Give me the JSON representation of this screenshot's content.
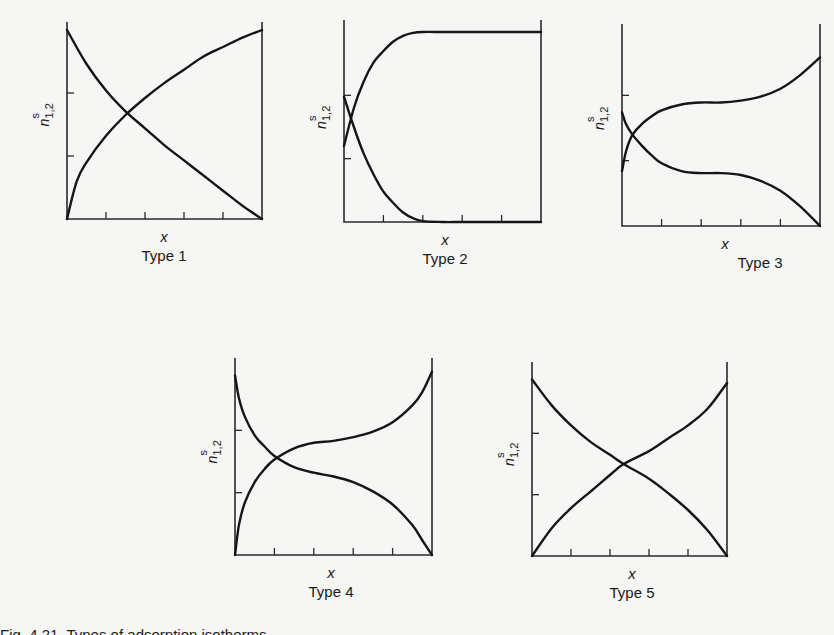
{
  "figure": {
    "caption_partial": "Fig. 4.21. Types of adsorption isotherms"
  },
  "chart_data": [
    {
      "type": "line",
      "title": "Type 1",
      "xlabel": "x",
      "ylabel": "n^s_{1,2}",
      "xlim": [
        0,
        1
      ],
      "ylim": [
        0,
        1
      ],
      "x_ticks": 4,
      "y_ticks": 2,
      "grid": false,
      "series": [
        {
          "name": "n^s_1 (decreasing)",
          "x": [
            0,
            0.1,
            0.2,
            0.3,
            0.4,
            0.5,
            0.6,
            0.7,
            0.8,
            0.9,
            1.0
          ],
          "y": [
            1.0,
            0.82,
            0.68,
            0.57,
            0.48,
            0.39,
            0.31,
            0.23,
            0.15,
            0.07,
            0.0
          ]
        },
        {
          "name": "n^s_2 (increasing)",
          "x": [
            0,
            0.05,
            0.1,
            0.2,
            0.3,
            0.4,
            0.5,
            0.6,
            0.7,
            0.8,
            0.9,
            1.0
          ],
          "y": [
            0.0,
            0.2,
            0.3,
            0.44,
            0.55,
            0.64,
            0.72,
            0.79,
            0.86,
            0.91,
            0.96,
            1.0
          ]
        }
      ]
    },
    {
      "type": "line",
      "title": "Type 2",
      "xlabel": "x",
      "ylabel": "n^s_{1,2}",
      "xlim": [
        0,
        1
      ],
      "ylim": [
        0,
        1
      ],
      "x_ticks": 4,
      "y_ticks": 2,
      "grid": false,
      "series": [
        {
          "name": "n^s_1 (decreasing)",
          "x": [
            0,
            0.05,
            0.1,
            0.15,
            0.2,
            0.25,
            0.3,
            0.35,
            0.4,
            0.5,
            0.6,
            0.8,
            1.0
          ],
          "y": [
            0.66,
            0.5,
            0.36,
            0.25,
            0.16,
            0.1,
            0.05,
            0.02,
            0.005,
            0,
            0,
            0,
            0
          ]
        },
        {
          "name": "n^s_2 (increasing)",
          "x": [
            0,
            0.05,
            0.1,
            0.15,
            0.2,
            0.25,
            0.3,
            0.35,
            0.4,
            0.5,
            0.6,
            0.8,
            1.0
          ],
          "y": [
            0.4,
            0.6,
            0.74,
            0.84,
            0.9,
            0.95,
            0.98,
            0.995,
            1.0,
            1.0,
            1.0,
            1.0,
            1.0
          ]
        }
      ]
    },
    {
      "type": "line",
      "title": "Type 3",
      "xlabel": "x",
      "ylabel": "n^s_{1,2}",
      "xlim": [
        0,
        1
      ],
      "ylim": [
        0,
        1
      ],
      "x_ticks": 4,
      "y_ticks": 2,
      "grid": false,
      "series": [
        {
          "name": "n^s_1 (decreasing)",
          "x": [
            0,
            0.02,
            0.05,
            0.1,
            0.15,
            0.2,
            0.3,
            0.4,
            0.5,
            0.6,
            0.7,
            0.8,
            0.9,
            1.0
          ],
          "y": [
            0.58,
            0.52,
            0.47,
            0.41,
            0.36,
            0.32,
            0.28,
            0.27,
            0.27,
            0.26,
            0.23,
            0.18,
            0.1,
            0.0
          ]
        },
        {
          "name": "n^s_2 (increasing)",
          "x": [
            0,
            0.02,
            0.05,
            0.1,
            0.15,
            0.2,
            0.3,
            0.4,
            0.5,
            0.6,
            0.7,
            0.8,
            0.9,
            1.0
          ],
          "y": [
            0.28,
            0.38,
            0.46,
            0.52,
            0.56,
            0.59,
            0.62,
            0.63,
            0.63,
            0.64,
            0.66,
            0.7,
            0.77,
            0.86
          ]
        }
      ]
    },
    {
      "type": "line",
      "title": "Type 4",
      "xlabel": "x",
      "ylabel": "n^s_{1,2}",
      "xlim": [
        0,
        1
      ],
      "ylim": [
        0,
        1
      ],
      "x_ticks": 4,
      "y_ticks": 2,
      "grid": false,
      "series": [
        {
          "name": "n^s_1 (decreasing)",
          "x": [
            0,
            0.02,
            0.05,
            0.1,
            0.15,
            0.2,
            0.3,
            0.4,
            0.5,
            0.6,
            0.7,
            0.8,
            0.9,
            0.95,
            1.0
          ],
          "y": [
            0.96,
            0.84,
            0.74,
            0.64,
            0.58,
            0.53,
            0.47,
            0.44,
            0.42,
            0.39,
            0.34,
            0.27,
            0.16,
            0.08,
            0.0
          ]
        },
        {
          "name": "n^s_2 (increasing)",
          "x": [
            0,
            0.02,
            0.05,
            0.1,
            0.15,
            0.2,
            0.3,
            0.4,
            0.5,
            0.6,
            0.7,
            0.8,
            0.9,
            0.95,
            1.0
          ],
          "y": [
            0.0,
            0.16,
            0.28,
            0.39,
            0.46,
            0.51,
            0.57,
            0.6,
            0.61,
            0.63,
            0.66,
            0.71,
            0.8,
            0.87,
            0.98
          ]
        }
      ]
    },
    {
      "type": "line",
      "title": "Type 5",
      "xlabel": "x",
      "ylabel": "n^s_{1,2}",
      "xlim": [
        0,
        1
      ],
      "ylim": [
        0,
        1
      ],
      "x_ticks": 4,
      "y_ticks": 2,
      "grid": false,
      "series": [
        {
          "name": "n^s_1 (decreasing)",
          "x": [
            0,
            0.1,
            0.2,
            0.3,
            0.4,
            0.47,
            0.6,
            0.7,
            0.8,
            0.9,
            1.0
          ],
          "y": [
            0.96,
            0.82,
            0.71,
            0.62,
            0.55,
            0.5,
            0.42,
            0.34,
            0.25,
            0.14,
            0.0
          ]
        },
        {
          "name": "n^s_2 (increasing)",
          "x": [
            0,
            0.1,
            0.2,
            0.3,
            0.4,
            0.47,
            0.6,
            0.7,
            0.8,
            0.9,
            1.0
          ],
          "y": [
            0.0,
            0.15,
            0.26,
            0.35,
            0.44,
            0.5,
            0.57,
            0.64,
            0.71,
            0.8,
            0.94
          ]
        }
      ]
    }
  ]
}
